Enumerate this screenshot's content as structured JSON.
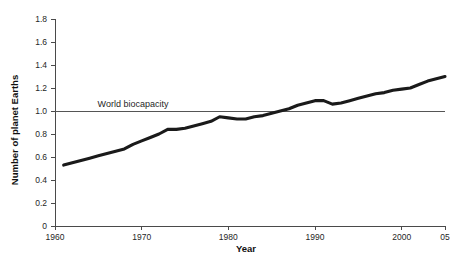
{
  "chart_data": {
    "type": "line",
    "title": "",
    "xlabel": "Year",
    "ylabel": "Number of planet Earths",
    "xlim": [
      1960,
      2005
    ],
    "ylim": [
      0,
      1.8
    ],
    "grid": false,
    "legend": "none",
    "x_tick_labels": [
      "1960",
      "1970",
      "1980",
      "1990",
      "2000",
      "05"
    ],
    "x_tick_values": [
      1960,
      1970,
      1980,
      1990,
      2000,
      2005
    ],
    "y_tick_labels": [
      "0",
      "0.2",
      "0.4",
      "0.6",
      "0.8",
      "1.0",
      "1.2",
      "1.4",
      "1.6",
      "1.8"
    ],
    "y_tick_values": [
      0,
      0.2,
      0.4,
      0.6,
      0.8,
      1.0,
      1.2,
      1.4,
      1.6,
      1.8
    ],
    "annotations": [
      {
        "text": "World biocapacity",
        "type": "reference-line-label",
        "y": 1.0
      }
    ],
    "reference_lines": [
      {
        "name": "World biocapacity",
        "y": 1.0,
        "color": "#555555"
      }
    ],
    "series": [
      {
        "name": "Humanity's Ecological Footprint",
        "color": "#1a1a1a",
        "x": [
          1961,
          1962,
          1963,
          1964,
          1965,
          1966,
          1967,
          1968,
          1969,
          1970,
          1971,
          1972,
          1973,
          1974,
          1975,
          1976,
          1977,
          1978,
          1979,
          1980,
          1981,
          1982,
          1983,
          1984,
          1985,
          1986,
          1987,
          1988,
          1989,
          1990,
          1991,
          1992,
          1993,
          1994,
          1995,
          1996,
          1997,
          1998,
          1999,
          2000,
          2001,
          2002,
          2003,
          2004,
          2005
        ],
        "values": [
          0.53,
          0.55,
          0.57,
          0.59,
          0.61,
          0.63,
          0.65,
          0.67,
          0.71,
          0.74,
          0.77,
          0.8,
          0.84,
          0.84,
          0.85,
          0.87,
          0.89,
          0.91,
          0.95,
          0.94,
          0.93,
          0.93,
          0.95,
          0.96,
          0.98,
          1.0,
          1.02,
          1.05,
          1.07,
          1.09,
          1.09,
          1.06,
          1.07,
          1.09,
          1.11,
          1.13,
          1.15,
          1.16,
          1.18,
          1.19,
          1.2,
          1.23,
          1.26,
          1.28,
          1.3
        ]
      }
    ]
  },
  "labels": {
    "y_axis_title": "Number of planet Earths",
    "x_axis_title": "Year",
    "biocapacity_note": "World biocapacity"
  },
  "colors": {
    "background": "#ffffff",
    "series": "#1a1a1a",
    "axis": "#4a4a4a",
    "reference": "#555555",
    "text": "#1a1a1a"
  }
}
